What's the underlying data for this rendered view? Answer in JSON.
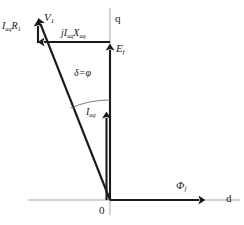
{
  "figure": {
    "background_color": "#ffffff",
    "vector_color": "#1a1a1a",
    "axis_color": "#9a9a9a",
    "arc_color": "#6e6e6e",
    "width": 244,
    "height": 225
  },
  "axes": {
    "q_axis": {
      "label": "q",
      "orientation": "vertical",
      "x": 110,
      "y_top": 8,
      "y_bottom": 215
    },
    "d_axis": {
      "label": "d",
      "orientation": "horizontal",
      "y": 200,
      "x_left": 28,
      "x_right": 240
    },
    "origin": {
      "label": "0",
      "x": 110,
      "y": 200
    }
  },
  "phasors": [
    {
      "name": "terminal-voltage",
      "label_main": "V",
      "label_sub": "1",
      "from": [
        110,
        200
      ],
      "to": [
        38,
        18
      ],
      "style": "thick-arrow"
    },
    {
      "name": "excitation-emf",
      "label_main": "E",
      "label_sub": "f",
      "from": [
        110,
        200
      ],
      "to": [
        110,
        42
      ],
      "style": "thick-arrow"
    },
    {
      "name": "armature-current",
      "label_main": "I",
      "label_sub": "aq",
      "from": [
        110,
        200
      ],
      "to": [
        107,
        110
      ],
      "style": "thick-arrow"
    },
    {
      "name": "reactance-drop",
      "label_prefix": "j",
      "label_main_1": "I",
      "label_sub_1": "aq",
      "label_main_2": "X",
      "label_sub_2": "aq",
      "from": [
        110,
        42
      ],
      "to": [
        38,
        42
      ],
      "style": "thick-arrow"
    },
    {
      "name": "resistance-drop",
      "label_main": "I",
      "label_sub": "aq",
      "label_main_2": "R",
      "label_sub_2": "1",
      "from": [
        38,
        42
      ],
      "to": [
        38,
        18
      ],
      "style": "thick-arrow"
    },
    {
      "name": "field-flux",
      "label_main": "Φ",
      "label_sub": "f",
      "from": [
        110,
        200
      ],
      "to": [
        205,
        200
      ],
      "style": "thick-arrow"
    }
  ],
  "labels": {
    "v1": {
      "main": "V",
      "sub": "1"
    },
    "iaq_r1": {
      "main": "I",
      "sub": "aq",
      "main2": "R",
      "sub2": "1"
    },
    "j_iaq_xaq": {
      "prefix": "j",
      "main": "I",
      "sub": "aq",
      "main2": "X",
      "sub2": "aq"
    },
    "ef": {
      "main": "E",
      "sub": "f"
    },
    "iaq": {
      "main": "I",
      "sub": "aq"
    },
    "phi_f": {
      "main": "Φ",
      "sub": "f"
    },
    "q_axis": "q",
    "d_axis": "d",
    "origin": "0",
    "angle": "δ=φ"
  },
  "angle_arc": {
    "text": "δ=φ",
    "center": [
      110,
      200
    ],
    "radius": 100,
    "from_deg": 90,
    "to_deg": 112
  }
}
